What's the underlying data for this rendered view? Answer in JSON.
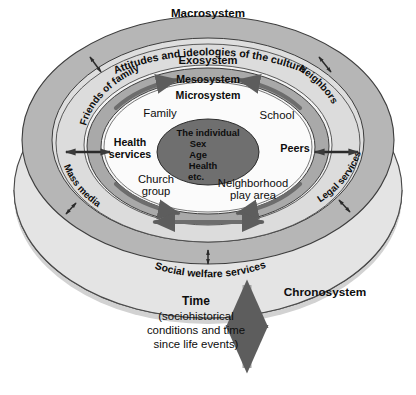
{
  "diagram": {
    "layers": [
      {
        "key": "chronosystem",
        "label": "Chronosystem",
        "color": "#e2e2e2"
      },
      {
        "key": "macrosystem",
        "label": "Macrosystem",
        "color": "#b4b4b4"
      },
      {
        "key": "exosystem",
        "label": "Exosystem",
        "color": "#dcdcdc"
      },
      {
        "key": "mesosystem",
        "label": "Mesosystem",
        "color": "#a8a8a8"
      },
      {
        "key": "microsystem",
        "label": "Microsystem",
        "color": "#f4f4f4"
      },
      {
        "key": "individual",
        "label": "The individual",
        "color": "#6e6e6e"
      }
    ],
    "macro_subtitle": "Attitudes and ideologies of the culture",
    "center": {
      "line1": "The individual",
      "line2": "Sex",
      "line3": "Age",
      "line4": "Health",
      "line5": "etc."
    },
    "microsystem_items": [
      {
        "key": "family",
        "label": "Family"
      },
      {
        "key": "school",
        "label": "School"
      },
      {
        "key": "church-group",
        "label_line1": "Church",
        "label_line2": "group"
      },
      {
        "key": "neighborhood",
        "label_line1": "Neighborhood",
        "label_line2": "play area"
      }
    ],
    "exosystem_items": [
      {
        "key": "health-services",
        "label_line1": "Health",
        "label_line2": "services"
      },
      {
        "key": "peers",
        "label": "Peers"
      },
      {
        "key": "friends-of-family",
        "label": "Friends of family"
      },
      {
        "key": "neighbors",
        "label": "Neighbors"
      },
      {
        "key": "mass-media",
        "label": "Mass media"
      },
      {
        "key": "legal-services",
        "label": "Legal services"
      },
      {
        "key": "social-welfare",
        "label": "Social welfare services"
      }
    ],
    "time": {
      "heading": "Time",
      "line1": "(sociohistorical",
      "line2": "conditions and time",
      "line3": "since life events)"
    }
  }
}
